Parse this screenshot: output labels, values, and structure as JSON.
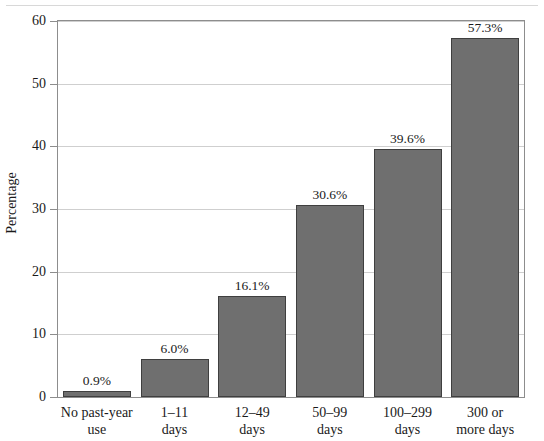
{
  "figure": {
    "top_rule": true,
    "frame": {
      "left": 57,
      "top": 20,
      "width": 468,
      "height": 378
    },
    "bar_fill": "#6f6f6f",
    "bar_stroke": "#3f3f3f",
    "grid_color": "#cfcfcf",
    "axis_color": "#8d8d8d"
  },
  "chart_data": {
    "type": "bar",
    "title": "",
    "subtitle": "",
    "xlabel": "",
    "ylabel": "Percentage",
    "ylim": [
      0,
      60
    ],
    "yticks": [
      0,
      10,
      20,
      30,
      40,
      50,
      60
    ],
    "ytick_labels": [
      "0",
      "10",
      "20",
      "30",
      "40",
      "50",
      "60"
    ],
    "grid": true,
    "grid_axis": "y",
    "legend": false,
    "categories": [
      "No past-year use",
      "1–11 days",
      "12–49 days",
      "50–99 days",
      "100–299 days",
      "300 or more days"
    ],
    "category_lines": [
      [
        "No past-year",
        "use"
      ],
      [
        "1–11",
        "days"
      ],
      [
        "12–49",
        "days"
      ],
      [
        "50–99",
        "days"
      ],
      [
        "100–299",
        "days"
      ],
      [
        "300 or",
        "more days"
      ]
    ],
    "values": [
      0.9,
      6.0,
      16.1,
      30.6,
      39.6,
      57.3
    ],
    "data_labels": [
      "0.9%",
      "6.0%",
      "16.1%",
      "30.6%",
      "39.6%",
      "57.3%"
    ]
  }
}
